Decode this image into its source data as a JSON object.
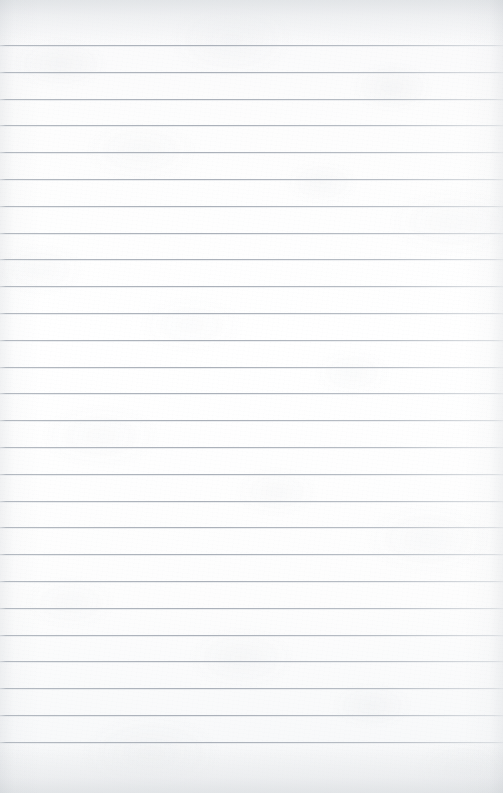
{
  "document": {
    "type": "lined-notebook-paper",
    "title": "",
    "body_text": "",
    "written_content": [],
    "is_blank": true,
    "page_width": 503,
    "page_height": 793
  },
  "paper": {
    "background_color": "#fbfbfc",
    "top_margin_color": "#f4f5f6",
    "bottom_margin_color": "#f2f3f4",
    "texture": "mottled-fibre",
    "vignette_color": "#969da6"
  },
  "ruling": {
    "line_color": "#aab0b9",
    "line_edge_color": "#c4c9cf",
    "line_thickness_px": 1,
    "line_spacing_px": 26.8,
    "first_line_y": 45,
    "last_line_y": 740,
    "line_count": 27,
    "line_positions": [
      45,
      71.8,
      98.6,
      125.4,
      152.2,
      179,
      205.8,
      232.6,
      259.4,
      286.2,
      313,
      339.8,
      366.6,
      393.4,
      420.2,
      447,
      473.8,
      500.6,
      527.4,
      554.2,
      581,
      607.8,
      634.6,
      661.4,
      688.2,
      715,
      741.8
    ],
    "left_inset_px": 0,
    "right_inset_px": 0
  }
}
